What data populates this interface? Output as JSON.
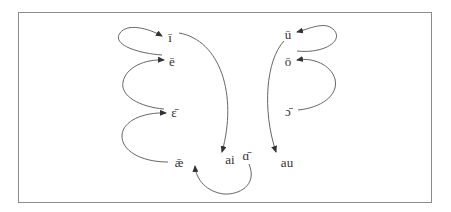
{
  "diagram": {
    "type": "vowel-shift-diagram",
    "colors": {
      "stroke": "#555555",
      "text": "#333333",
      "border": "#8c8c8c"
    },
    "nodes": [
      {
        "id": "i_long",
        "label": "ī",
        "x": 170,
        "y": 37
      },
      {
        "id": "e_long",
        "label": "ē",
        "x": 172,
        "y": 61
      },
      {
        "id": "eps_long",
        "label": "ɛ̄",
        "x": 174,
        "y": 112
      },
      {
        "id": "ae_long",
        "label": "ǣ",
        "x": 179,
        "y": 162
      },
      {
        "id": "ai",
        "label": "ai",
        "x": 230,
        "y": 159
      },
      {
        "id": "a_long",
        "label": "ɑ̄",
        "x": 246,
        "y": 155
      },
      {
        "id": "u_long",
        "label": "ū",
        "x": 288,
        "y": 34
      },
      {
        "id": "o_long",
        "label": "ō",
        "x": 288,
        "y": 61
      },
      {
        "id": "open_o_long",
        "label": "ɔ̄",
        "x": 288,
        "y": 111
      },
      {
        "id": "au",
        "label": "au",
        "x": 287,
        "y": 162
      }
    ],
    "edges": [
      {
        "from": "e_long",
        "to": "i_long"
      },
      {
        "from": "eps_long",
        "to": "e_long"
      },
      {
        "from": "ae_long",
        "to": "eps_long"
      },
      {
        "from": "i_long",
        "to": "ai"
      },
      {
        "from": "a_long",
        "to": "ae_long"
      },
      {
        "from": "o_long",
        "to": "u_long"
      },
      {
        "from": "open_o_long",
        "to": "o_long"
      },
      {
        "from": "u_long",
        "to": "au"
      }
    ]
  }
}
